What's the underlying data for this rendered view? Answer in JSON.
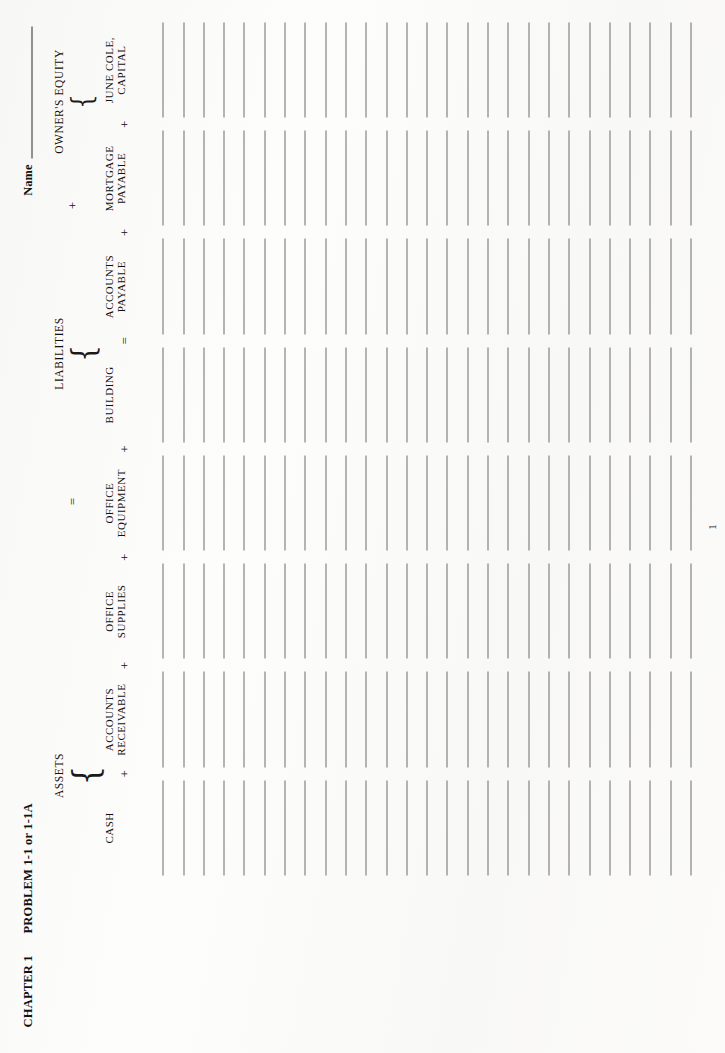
{
  "header": {
    "chapter": "CHAPTER 1",
    "problem": "PROBLEM 1-1 or 1-1A",
    "name_label": "Name"
  },
  "equation": {
    "assets_title": "ASSETS",
    "equals_sign": "=",
    "liabilities_title": "LIABILITIES",
    "plus_sign": "+",
    "owners_equity_title": "OWNER'S EQUITY",
    "brace_glyph": "{"
  },
  "columns": [
    {
      "id": "cash",
      "line1": "CASH",
      "line2": "",
      "op_before": "",
      "group": "assets"
    },
    {
      "id": "accounts-receivable",
      "line1": "ACCOUNTS",
      "line2": "RECEIVABLE",
      "op_before": "+",
      "group": "assets"
    },
    {
      "id": "office-supplies",
      "line1": "OFFICE",
      "line2": "SUPPLIES",
      "op_before": "+",
      "group": "assets"
    },
    {
      "id": "office-equipment",
      "line1": "OFFICE",
      "line2": "EQUIPMENT",
      "op_before": "+",
      "group": "assets"
    },
    {
      "id": "building",
      "line1": "BUILDING",
      "line2": "",
      "op_before": "+",
      "group": "assets"
    },
    {
      "id": "accounts-payable",
      "line1": "ACCOUNTS",
      "line2": "PAYABLE",
      "op_before": "=",
      "group": "liabilities"
    },
    {
      "id": "mortgage-payable",
      "line1": "MORTGAGE",
      "line2": "PAYABLE",
      "op_before": "+",
      "group": "liabilities"
    },
    {
      "id": "june-cole-capital",
      "line1": "JUNE COLE,",
      "line2": "CAPITAL",
      "op_before": "+",
      "group": "owners-equity"
    }
  ],
  "grid": {
    "row_count": 27,
    "rule_color": "#6d6d6d"
  },
  "footer": {
    "page_number": "1"
  },
  "colors": {
    "paper": "#fbfbfa",
    "ink": "#111111",
    "rule": "#6d6d6d"
  }
}
